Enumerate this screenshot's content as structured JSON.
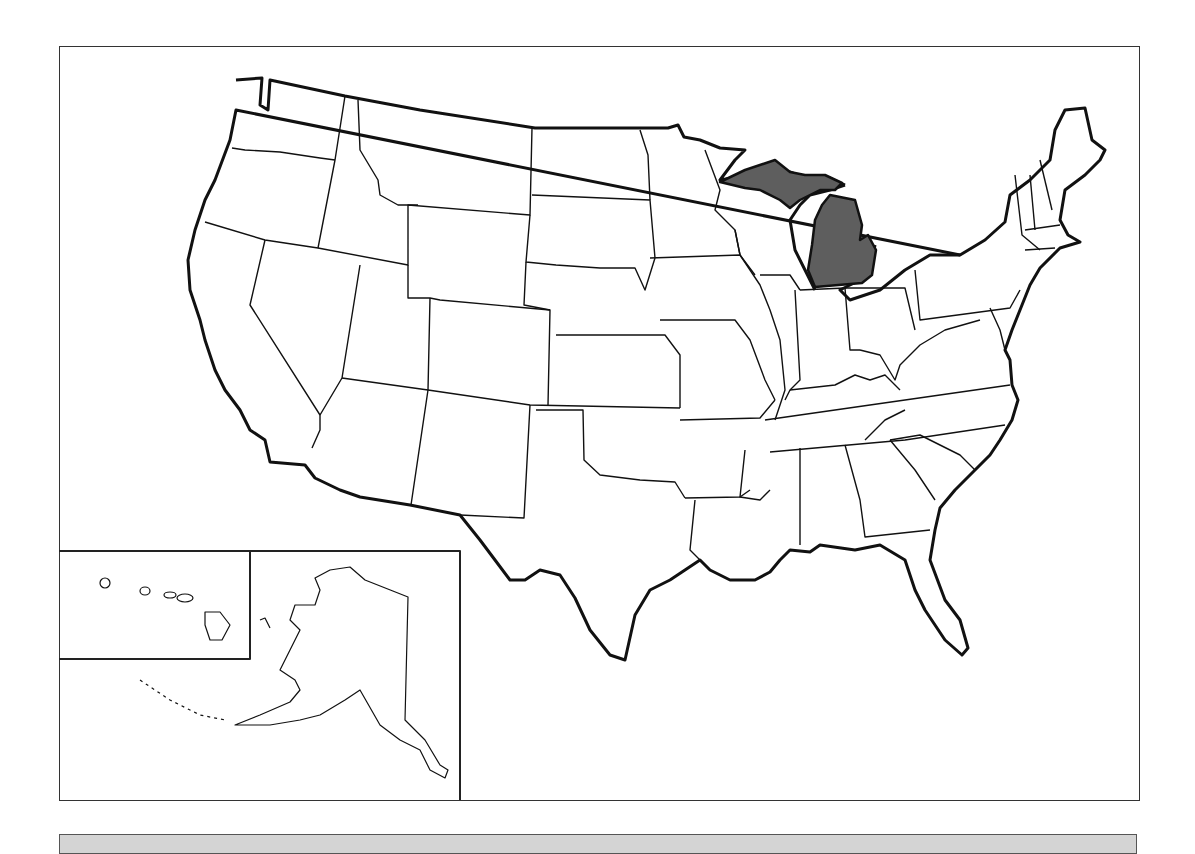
{
  "map": {
    "title": "United States Map",
    "highlighted_state": "Michigan",
    "highlight_color": "#5e5e5e",
    "outline_color": "#111111",
    "background_color": "#ffffff",
    "insets": [
      "Alaska",
      "Hawaii"
    ]
  },
  "bottom_bar": {
    "color": "#d4d4d4",
    "text": ""
  }
}
